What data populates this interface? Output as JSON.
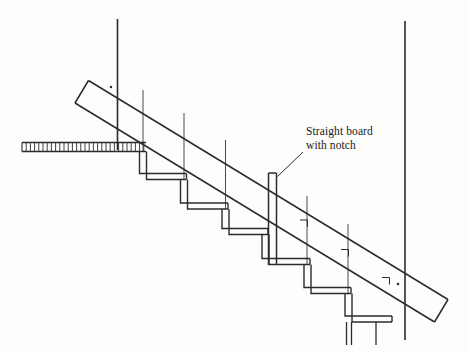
{
  "diagram": {
    "type": "technical-line-drawing",
    "background_color": "#fdfdfc",
    "line_color": "#2b2b2b",
    "annotations": [
      {
        "id": "straight-board-with-notch",
        "line1": "Straight board",
        "line2": "with notch",
        "x": 306,
        "y": 125,
        "leader": "diagonal line from text down-left to top of notch board"
      }
    ],
    "elements": {
      "wall_left_label": "left wall vertical line",
      "wall_right_label": "right wall vertical line",
      "floor_label": "hatched floor / landing",
      "stairs_label": "stepped stair profile with treads and risers",
      "board_label": "long straight board laid on stair nosings",
      "notch_board_label": "vertical straight board with notch"
    }
  }
}
